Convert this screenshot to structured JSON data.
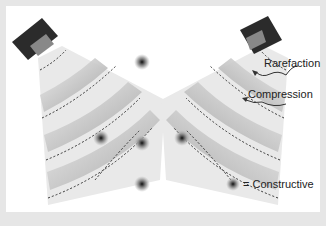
{
  "diagram": {
    "labels": {
      "rarefaction": "Rarefaction",
      "compression": "Compression",
      "legend": "= Constructive"
    },
    "colors": {
      "background_frame": "#e6e6e6",
      "panel": "#ffffff",
      "speaker": "#2b2b2b",
      "beam_light": "#e8e8e8",
      "beam_dark": "#9a9a9a",
      "node": "#8a8a8a",
      "node_center": "#111111",
      "dash": "#333333"
    },
    "speakers": [
      {
        "name": "left-speaker"
      },
      {
        "name": "right-speaker"
      }
    ],
    "constructive_nodes": 5
  }
}
